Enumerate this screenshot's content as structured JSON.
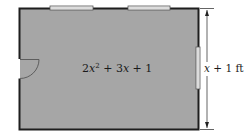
{
  "diagram": {
    "area_label": {
      "coef": "2",
      "var1": "x",
      "exp": "2",
      "rest": " + 3",
      "var2": "x",
      "tail": " + 1"
    },
    "dimension_label": {
      "var": "x",
      "rest": " + 1 ft"
    },
    "colors": {
      "room_fill": "#a6a6a6",
      "wall": "#1e1e1e",
      "window_fill": "#f2f2f2",
      "window_stroke": "#555555",
      "arrow": "#222222"
    },
    "features": [
      "top-window-left",
      "top-window-right",
      "right-window",
      "left-door"
    ]
  }
}
